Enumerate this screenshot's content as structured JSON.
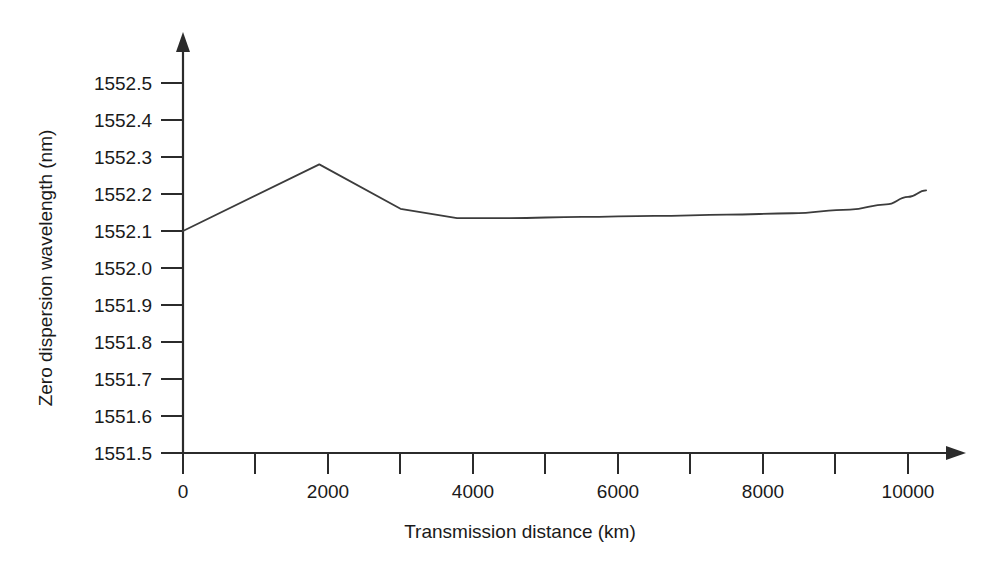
{
  "chart_data": {
    "type": "line",
    "title": "",
    "subtitle": "",
    "xlabel": "Transmission distance (km)",
    "ylabel": "Zero dispersion wavelength (nm)",
    "xlim": [
      0,
      10600
    ],
    "ylim": [
      1551.5,
      1552.55
    ],
    "grid": false,
    "legend": null,
    "legend_position": "none",
    "x_ticks": [
      0,
      1000,
      2000,
      3000,
      4000,
      5000,
      6000,
      7000,
      8000,
      9000,
      10000
    ],
    "x_tick_labels": [
      "0",
      "",
      "2000",
      "",
      "4000",
      "",
      "6000",
      "",
      "8000",
      "",
      "10000"
    ],
    "y_ticks": [
      1551.5,
      1551.6,
      1551.7,
      1551.8,
      1551.9,
      1552.0,
      1552.1,
      1552.2,
      1552.3,
      1552.4,
      1552.5
    ],
    "y_tick_labels": [
      "1551.5",
      "1551.6",
      "1551.7",
      "1551.8",
      "1551.9",
      "1552.0",
      "1552.1",
      "1552.2",
      "1552.3",
      "1552.4",
      "1552.5"
    ],
    "series": [
      {
        "name": "Zero dispersion wavelength",
        "color": "#3c3c3c",
        "x": [
          0,
          1880,
          3000,
          3780,
          4500,
          5500,
          6500,
          7500,
          8400,
          9200,
          9700,
          10000,
          10250
        ],
        "y": [
          1552.1,
          1552.28,
          1552.16,
          1552.135,
          1552.135,
          1552.138,
          1552.141,
          1552.144,
          1552.148,
          1552.158,
          1552.172,
          1552.192,
          1552.21
        ]
      }
    ],
    "annotations": []
  },
  "axis_style": {
    "line_color": "#2b2b2b",
    "background": "#ffffff",
    "has_x_arrow": true,
    "has_y_arrow": true
  }
}
